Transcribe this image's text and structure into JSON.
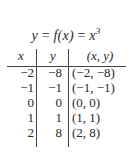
{
  "title": {
    "lhs": "y",
    "eq1": " = ",
    "func": "f(x)",
    "eq2": " = ",
    "base": "x",
    "exponent": "3"
  },
  "table": {
    "headers": [
      "x",
      "y",
      "(x, y)"
    ],
    "rows": [
      {
        "x": "−2",
        "y": "−8",
        "pair": "(−2, −8)"
      },
      {
        "x": "−1",
        "y": "−1",
        "pair": "(−1, −1)"
      },
      {
        "x": "0",
        "y": "0",
        "pair": "(0, 0)"
      },
      {
        "x": "1",
        "y": "1",
        "pair": "(1, 1)"
      },
      {
        "x": "2",
        "y": "8",
        "pair": "(2, 8)"
      }
    ]
  }
}
